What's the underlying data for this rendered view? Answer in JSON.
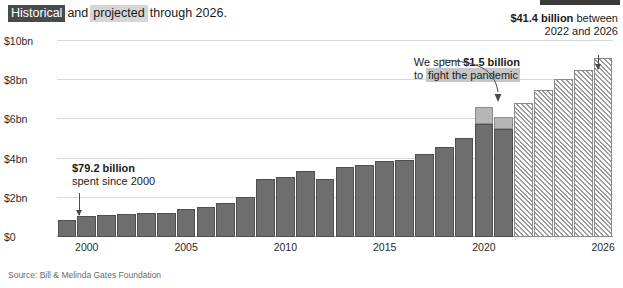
{
  "headline": {
    "highlight_dark": "Historical",
    "mid_plain": "and",
    "highlight_light": "projected",
    "tail_plain": "through 2026."
  },
  "source": "Source: Bill & Melinda Gates Foundation",
  "annotations": {
    "historical": {
      "line1": "$79.2 billion",
      "line2": "spent since 2000"
    },
    "covid": {
      "line1_prefix": "We spent ",
      "line1_bold": "$1.5 billion",
      "line2_prefix": "to ",
      "line2_mark": "fight the pandemic"
    },
    "future": {
      "line1_bold": "$41.4 billion",
      "line1_tail": " between",
      "line2": "2022 and 2026"
    }
  },
  "colors": {
    "historical_bar": "#6e6e6e",
    "covid_bar": "#b7b7b7",
    "projected_bar": "#ececec",
    "gridline": "#d9d9d9",
    "highlight_dark": "#4a4a4a",
    "highlight_light": "#d6d6d6"
  },
  "chart_data": {
    "type": "bar",
    "xlabel": "",
    "ylabel": "",
    "ylim": [
      0,
      10
    ],
    "y_unit": "billion USD",
    "ytick_values": [
      0,
      2,
      4,
      6,
      8,
      10
    ],
    "ytick_labels": [
      "$0",
      "$2bn",
      "$4bn",
      "$6bn",
      "$8bn",
      "$10bn"
    ],
    "xtick_values": [
      2000,
      2005,
      2010,
      2015,
      2020,
      2026
    ],
    "xtick_labels": [
      "2000",
      "2005",
      "2010",
      "2015",
      "2020",
      "2026"
    ],
    "grid": true,
    "legend_position": "none",
    "categories": [
      1999,
      2000,
      2001,
      2002,
      2003,
      2004,
      2005,
      2006,
      2007,
      2008,
      2009,
      2010,
      2011,
      2012,
      2013,
      2014,
      2015,
      2016,
      2017,
      2018,
      2019,
      2020,
      2021,
      2022,
      2023,
      2024,
      2025,
      2026
    ],
    "series": [
      {
        "name": "Historical grants",
        "style": "solid-dark",
        "values": [
          0.85,
          1.05,
          1.1,
          1.15,
          1.2,
          1.25,
          1.45,
          1.55,
          1.75,
          2.05,
          2.95,
          3.05,
          3.35,
          2.95,
          3.55,
          3.65,
          3.9,
          3.95,
          4.25,
          4.6,
          5.05,
          5.75,
          5.5,
          null,
          null,
          null,
          null,
          null
        ]
      },
      {
        "name": "Pandemic response",
        "style": "solid-light-gray",
        "values": [
          null,
          null,
          null,
          null,
          null,
          null,
          null,
          null,
          null,
          null,
          null,
          null,
          null,
          null,
          null,
          null,
          null,
          null,
          null,
          null,
          null,
          0.9,
          0.6,
          null,
          null,
          null,
          null,
          null
        ]
      },
      {
        "name": "Projected grants",
        "style": "hatched",
        "values": [
          null,
          null,
          null,
          null,
          null,
          null,
          null,
          null,
          null,
          null,
          null,
          null,
          null,
          null,
          null,
          null,
          null,
          null,
          null,
          null,
          null,
          null,
          null,
          6.85,
          7.5,
          8.05,
          8.5,
          9.15
        ]
      }
    ],
    "annotations": [
      {
        "text": "$79.2 billion spent since 2000",
        "target_year": 2000
      },
      {
        "text": "We spent $1.5 billion to fight the pandemic",
        "target_year": 2021
      },
      {
        "text": "$41.4 billion between 2022 and 2026",
        "target_year": 2026
      }
    ]
  }
}
